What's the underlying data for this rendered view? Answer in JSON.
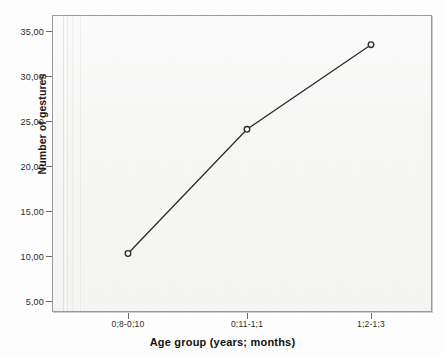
{
  "chart_data": {
    "type": "line",
    "title": "",
    "subtitle": "",
    "xlabel": "Age group (years; months)",
    "ylabel": "Number of gestures",
    "categories": [
      "0;8-0;10",
      "0;11-1;1",
      "1;2-1;3"
    ],
    "values": [
      10.0,
      23.8,
      33.2
    ],
    "series": [
      {
        "name": "Number of gestures",
        "values": [
          10.0,
          23.8,
          33.2
        ]
      }
    ],
    "ylim": [
      3.5,
      36.5
    ],
    "yticks": [
      5,
      10,
      15,
      20,
      25,
      30,
      35
    ],
    "ytick_labels": [
      "5,00",
      "10,00",
      "15,00",
      "20,00",
      "25,00",
      "30,00",
      "35,00"
    ],
    "xtick_labels": [
      "0;8-0;10",
      "0;11-1;1",
      "1;2-1;3"
    ],
    "grid": false,
    "legend": false,
    "legend_position": "none",
    "marker": "open-circle",
    "line_color": "#2b2b2b",
    "marker_color": "#2b2b2b",
    "plot_background": "#f7f7f6",
    "frame_color": "#9a9a9a",
    "decimal_separator": ","
  },
  "axes": {
    "y": {
      "title": "Number of gestures",
      "ticks": [
        {
          "label": "35,00",
          "value": 35
        },
        {
          "label": "30,00",
          "value": 30
        },
        {
          "label": "25,00",
          "value": 25
        },
        {
          "label": "20,00",
          "value": 20
        },
        {
          "label": "15,00",
          "value": 15
        },
        {
          "label": "10,00",
          "value": 10
        },
        {
          "label": "5,00",
          "value": 5
        }
      ]
    },
    "x": {
      "title": "Age group (years; months)",
      "ticks": [
        {
          "label": "0;8-0;10"
        },
        {
          "label": "0;11-1;1"
        },
        {
          "label": "1;2-1;3"
        }
      ]
    }
  },
  "points": [
    {
      "category": "0;8-0;10",
      "value": 10.0
    },
    {
      "category": "0;11-1;1",
      "value": 23.8
    },
    {
      "category": "1;2-1;3",
      "value": 33.2
    }
  ]
}
